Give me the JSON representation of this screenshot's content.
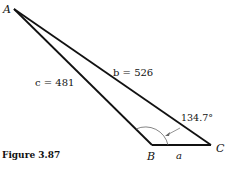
{
  "figure": {
    "caption": "Figure 3.87",
    "vertices": {
      "A": {
        "label": "A",
        "x": 14,
        "y": 9
      },
      "B": {
        "label": "B",
        "x": 152,
        "y": 145
      },
      "C": {
        "label": "C",
        "x": 211,
        "y": 145
      }
    },
    "sides": {
      "a": {
        "label": "a"
      },
      "b": {
        "label": "b = 526"
      },
      "c": {
        "label": "c = 481"
      }
    },
    "angle": {
      "label": "134.7°",
      "vertex": "B"
    }
  }
}
